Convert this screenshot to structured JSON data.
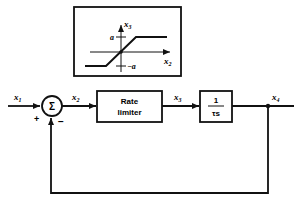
{
  "diagram": {
    "type": "block-diagram",
    "inset": {
      "title": "saturation characteristic",
      "x_axis_label": "x",
      "x_axis_sub": "2",
      "y_axis_label": "x",
      "y_axis_sub": "3",
      "upper_level_label": "a",
      "lower_level_label": "−a"
    },
    "signals": {
      "x1": {
        "label": "x",
        "sub": "1"
      },
      "x2": {
        "label": "x",
        "sub": "2"
      },
      "x3": {
        "label": "x",
        "sub": "3"
      },
      "x4": {
        "label": "x",
        "sub": "4"
      }
    },
    "summing_junction": {
      "symbol": "Σ",
      "plus_sign": "+",
      "minus_sign": "−"
    },
    "blocks": [
      {
        "id": "rate-limiter",
        "line1": "Rate",
        "line2": "limiter"
      },
      {
        "id": "integrator",
        "numerator": "1",
        "denominator": "τs"
      }
    ],
    "colors": {
      "stroke": "#111111",
      "background": "#ffffff"
    }
  }
}
